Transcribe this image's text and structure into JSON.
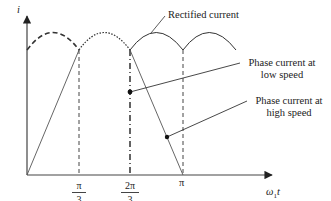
{
  "diagram": {
    "title": "",
    "axes": {
      "y_label": "i",
      "x_label_main": "ω",
      "x_label_sub": "1",
      "x_label_tail": "t",
      "ticks": [
        {
          "num": "π",
          "den": "3"
        },
        {
          "num": "2π",
          "den": "3"
        },
        {
          "single": "π"
        }
      ]
    },
    "annotations": {
      "rectified": "Rectified current",
      "low_speed_line1": "Phase current at",
      "low_speed_line2": "low speed",
      "high_speed_line1": "Phase current at",
      "high_speed_line2": "high speed"
    },
    "colors": {
      "line": "#333333",
      "background": "#ffffff"
    }
  }
}
